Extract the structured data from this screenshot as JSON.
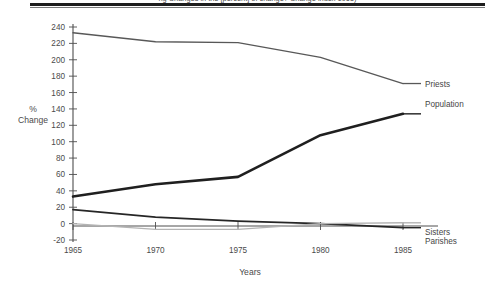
{
  "figure": {
    "name": "line-chart-percent-change-1965-1985",
    "title_partial": "ng Changes in the [percent] of change? Change index 1965)"
  },
  "chart_data": {
    "type": "line",
    "title": "",
    "xlabel": "Years",
    "ylabel": "% Change",
    "x": [
      1965,
      1970,
      1975,
      1980,
      1985
    ],
    "xtick_labels": [
      "1965",
      "1970",
      "1975",
      "1980",
      "1985"
    ],
    "xlim": [
      1965,
      1985
    ],
    "ylim": [
      -20,
      240
    ],
    "ytick_labels": [
      "240",
      "220",
      "200",
      "180",
      "160",
      "140",
      "120",
      "100",
      "80",
      "60",
      "40",
      "20",
      "0",
      "-20"
    ],
    "ytick_values": [
      240,
      220,
      200,
      180,
      160,
      140,
      120,
      100,
      80,
      60,
      40,
      20,
      0,
      -20
    ],
    "grid": false,
    "legend_position": "right-inline-labels",
    "series": [
      {
        "name": "Priests",
        "label": "Priests",
        "color": "#585858",
        "width": 1.3,
        "values": [
          233,
          222,
          221,
          203,
          171
        ]
      },
      {
        "name": "Population",
        "label": "Population",
        "color": "#1f1f1f",
        "width": 2.6,
        "values": [
          33,
          48,
          57,
          108,
          134
        ]
      },
      {
        "name": "Sisters",
        "label": "Sisters",
        "color": "#262626",
        "width": 1.8,
        "values": [
          17,
          8,
          3,
          0,
          -5
        ]
      },
      {
        "name": "Parishes",
        "label": "Parishes",
        "color": "#b4b4b4",
        "width": 1.4,
        "values": [
          0,
          -7,
          -7,
          0,
          1
        ]
      }
    ]
  }
}
